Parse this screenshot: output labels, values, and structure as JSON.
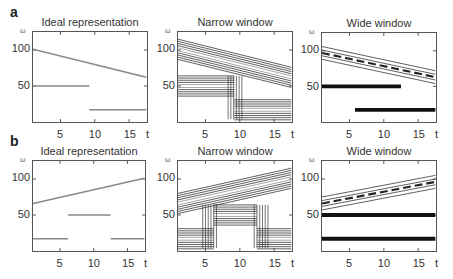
{
  "rows": [
    {
      "label": "a"
    },
    {
      "label": "b"
    }
  ],
  "axes": {
    "ylabel": "ω",
    "xlabel": "t",
    "yticks": [
      "100",
      "50"
    ],
    "xticks": [
      "5",
      "10",
      "15"
    ]
  },
  "chart_data": [
    {
      "id": "a-ideal",
      "type": "line",
      "title": "Ideal representation",
      "xlabel": "t",
      "ylabel": "ω",
      "xlim": [
        1,
        17.5
      ],
      "ylim": [
        0,
        125
      ],
      "xticks": [
        5,
        10,
        15
      ],
      "yticks": [
        50,
        100
      ],
      "series": [
        {
          "name": "chirp down",
          "x": [
            1,
            17.5
          ],
          "y": [
            101,
            62
          ]
        },
        {
          "name": "tone 50",
          "x": [
            1,
            9.2
          ],
          "y": [
            50,
            50
          ]
        },
        {
          "name": "tone 17",
          "x": [
            9.2,
            17.5
          ],
          "y": [
            17,
            17
          ]
        }
      ]
    },
    {
      "id": "a-narrow",
      "type": "heatmap",
      "title": "Narrow window",
      "xlabel": "t",
      "ylabel": "ω",
      "xlim": [
        1,
        17.5
      ],
      "ylim": [
        0,
        125
      ],
      "note": "contour plot; broad frequency spread, sharp time transition at t≈9–10",
      "series": [
        {
          "name": "chirp down",
          "x": [
            1,
            17.5
          ],
          "y": [
            101,
            62
          ]
        },
        {
          "name": "tone 50",
          "x": [
            1,
            9.2
          ],
          "y": [
            50,
            50
          ]
        },
        {
          "name": "tone 17",
          "x": [
            9.2,
            17.5
          ],
          "y": [
            17,
            17
          ]
        }
      ]
    },
    {
      "id": "a-wide",
      "type": "heatmap",
      "title": "Wide window",
      "xlabel": "t",
      "ylabel": "ω",
      "xlim": [
        1,
        17.5
      ],
      "ylim": [
        0,
        125
      ],
      "note": "contour plot; narrow frequency lines, smeared chirp",
      "series": [
        {
          "name": "chirp down",
          "x": [
            1,
            17.5
          ],
          "y": [
            97,
            63
          ]
        },
        {
          "name": "tone 50",
          "x": [
            1,
            12.5
          ],
          "y": [
            50,
            50
          ]
        },
        {
          "name": "tone 17",
          "x": [
            5.8,
            17.5
          ],
          "y": [
            17,
            17
          ]
        }
      ]
    },
    {
      "id": "b-ideal",
      "type": "line",
      "title": "Ideal representation",
      "xlabel": "t",
      "ylabel": "ω",
      "xlim": [
        1,
        17.5
      ],
      "ylim": [
        0,
        125
      ],
      "xticks": [
        5,
        10,
        15
      ],
      "yticks": [
        50,
        100
      ],
      "series": [
        {
          "name": "chirp up",
          "x": [
            1,
            17.5
          ],
          "y": [
            66,
            101
          ]
        },
        {
          "name": "tone 50",
          "x": [
            6.2,
            12.5
          ],
          "y": [
            50,
            50
          ]
        },
        {
          "name": "tone 17 (early)",
          "x": [
            1,
            6.2
          ],
          "y": [
            17,
            17
          ]
        },
        {
          "name": "tone 17 (late)",
          "x": [
            12.5,
            17.5
          ],
          "y": [
            17,
            17
          ]
        }
      ]
    },
    {
      "id": "b-narrow",
      "type": "heatmap",
      "title": "Narrow window",
      "xlabel": "t",
      "ylabel": "ω",
      "xlim": [
        1,
        17.5
      ],
      "ylim": [
        0,
        125
      ],
      "note": "contour plot; broad frequency spread, transitions at t≈5 and t≈13",
      "series": [
        {
          "name": "chirp up",
          "x": [
            1,
            17.5
          ],
          "y": [
            66,
            101
          ]
        },
        {
          "name": "tone 50",
          "x": [
            6.2,
            12.5
          ],
          "y": [
            50,
            50
          ]
        },
        {
          "name": "tone 17 (early)",
          "x": [
            1,
            6.2
          ],
          "y": [
            17,
            17
          ]
        },
        {
          "name": "tone 17 (late)",
          "x": [
            12.5,
            17.5
          ],
          "y": [
            17,
            17
          ]
        }
      ]
    },
    {
      "id": "b-wide",
      "type": "heatmap",
      "title": "Wide window",
      "xlabel": "t",
      "ylabel": "ω",
      "xlim": [
        1,
        17.5
      ],
      "ylim": [
        0,
        125
      ],
      "note": "contour plot; tones smeared over whole time span",
      "series": [
        {
          "name": "chirp up",
          "x": [
            1,
            17.5
          ],
          "y": [
            66,
            96
          ]
        },
        {
          "name": "tone 50",
          "x": [
            1,
            17.5
          ],
          "y": [
            50,
            50
          ]
        },
        {
          "name": "tone 17",
          "x": [
            1,
            17.5
          ],
          "y": [
            17,
            17
          ]
        }
      ]
    }
  ]
}
